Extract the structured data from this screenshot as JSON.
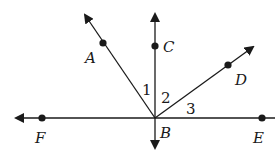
{
  "diagram": {
    "type": "geometry-angles",
    "vertex": {
      "label": "B"
    },
    "points": [
      {
        "label": "A"
      },
      {
        "label": "C"
      },
      {
        "label": "D"
      },
      {
        "label": "E"
      },
      {
        "label": "F"
      }
    ],
    "angles": [
      {
        "label": "1",
        "between": "BA-BC"
      },
      {
        "label": "2",
        "between": "BC-BD"
      },
      {
        "label": "3",
        "between": "BD-BE"
      }
    ],
    "colors": {
      "line": "#1a1a1a",
      "background": "#ffffff"
    }
  }
}
